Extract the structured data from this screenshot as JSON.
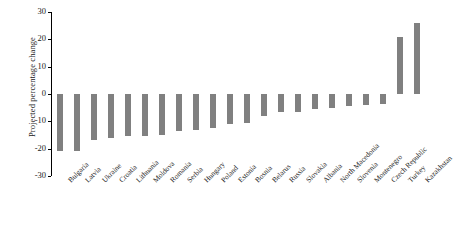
{
  "chart": {
    "type": "bar",
    "title": "",
    "ylabel": "Projected percentage change",
    "xlabel": "",
    "bar_color": "#808080",
    "axis_color": "#000000",
    "grid": false,
    "legend": false
  },
  "yaxis": {
    "ticks": [
      "30",
      "20",
      "10",
      "0",
      "-10",
      "-20",
      "-30"
    ],
    "min": -30,
    "max": 30,
    "step": 10
  },
  "chart_data": {
    "type": "bar",
    "title": "",
    "xlabel": "",
    "ylabel": "Projected percentage change",
    "ylim": [
      -30,
      30
    ],
    "ytick_step": 10,
    "grid": false,
    "legend_position": "none",
    "orientation": "vertical",
    "bar_color": "#808080",
    "categories": [
      "Bulgaria",
      "Latvia",
      "Ukraine",
      "Croatia",
      "Lithuania",
      "Moldova",
      "Romania",
      "Serbia",
      "Hungary",
      "Poland",
      "Estonia",
      "Bosnia",
      "Belarus",
      "Russia",
      "Slovakia",
      "Albania",
      "North Macedonia",
      "Slovenia",
      "Montenegro",
      "Czech Republic",
      "Turkey",
      "Kazakhstan"
    ],
    "values": [
      -21.0,
      -21.0,
      -17.0,
      -16.0,
      -15.5,
      -15.5,
      -15.0,
      -13.5,
      -13.0,
      -12.5,
      -11.0,
      -10.5,
      -8.0,
      -6.5,
      -6.5,
      -5.5,
      -5.0,
      -4.5,
      -4.0,
      -3.5,
      21.0,
      26.0
    ]
  }
}
